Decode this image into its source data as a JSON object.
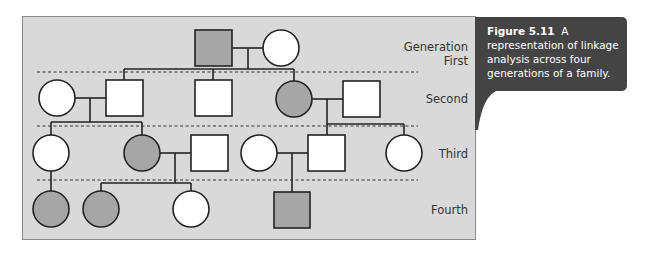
{
  "figure": {
    "caption_number": "Figure 5.11",
    "caption_text": "A representation of linkage analysis across four generations of a family.",
    "caption_bg": "#444444",
    "panel_bg": "#d9d9d9",
    "affected_fill": "#a6a6a6",
    "unaffected_fill": "#ffffff"
  },
  "generations": {
    "label_top": "Generation",
    "first": "First",
    "second": "Second",
    "third": "Third",
    "fourth": "Fourth"
  },
  "pedigree": {
    "legend": {
      "square": "male",
      "circle": "female",
      "shaded": "affected"
    },
    "first": [
      {
        "sex": "male",
        "affected": true
      },
      {
        "sex": "female",
        "affected": false
      }
    ],
    "second": [
      {
        "sex": "female",
        "affected": false,
        "note": "married-in"
      },
      {
        "sex": "male",
        "affected": false
      },
      {
        "sex": "male",
        "affected": false
      },
      {
        "sex": "female",
        "affected": true
      },
      {
        "sex": "male",
        "affected": false,
        "note": "married-in"
      }
    ],
    "third": [
      {
        "sex": "female",
        "affected": false
      },
      {
        "sex": "female",
        "affected": true
      },
      {
        "sex": "male",
        "affected": false,
        "note": "married-in"
      },
      {
        "sex": "female",
        "affected": false,
        "note": "married-in"
      },
      {
        "sex": "male",
        "affected": false
      },
      {
        "sex": "female",
        "affected": false
      }
    ],
    "fourth": [
      {
        "sex": "female",
        "affected": true
      },
      {
        "sex": "female",
        "affected": true
      },
      {
        "sex": "female",
        "affected": false
      },
      {
        "sex": "male",
        "affected": true
      }
    ]
  }
}
